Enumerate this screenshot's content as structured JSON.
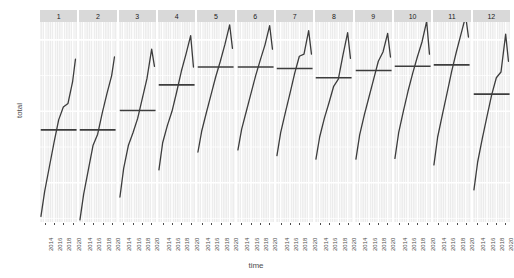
{
  "chart_data": {
    "type": "line",
    "title": "",
    "xlabel": "time",
    "ylabel": "total",
    "grid": true,
    "legend": false,
    "facet_variable": "month",
    "facet_labels": [
      "1",
      "2",
      "3",
      "4",
      "5",
      "6",
      "7",
      "8",
      "9",
      "10",
      "11",
      "12"
    ],
    "x_tick_labels": [
      "2014",
      "2016",
      "2018",
      "2020"
    ],
    "x_ticks": [
      2014,
      2016,
      2018,
      2020
    ],
    "xlim": [
      2013.0,
      2021.0
    ],
    "y_tick_labels": [
      "27000",
      "26000",
      "25000"
    ],
    "y_ticks": [
      27000,
      26000,
      25000
    ],
    "ylim": [
      24450,
      27250
    ],
    "line_color": "#3d3d3d",
    "panel_bg": "#ebebeb",
    "strip_bg": "#d9d9d9",
    "gridline_color": "#ffffff",
    "series": [
      {
        "name": "1",
        "x": [
          2013.2,
          2014,
          2015,
          2016,
          2017,
          2018,
          2019,
          2020,
          2020.6
        ],
        "values": [
          24530,
          24880,
          25220,
          25560,
          25880,
          26060,
          26110,
          26420,
          26730
        ],
        "mean_line": 25740
      },
      {
        "name": "2",
        "x": [
          2013.2,
          2014,
          2015,
          2016,
          2017,
          2018,
          2019,
          2020,
          2020.6
        ],
        "values": [
          24480,
          24840,
          25180,
          25520,
          25680,
          25980,
          26250,
          26500,
          26760
        ],
        "mean_line": 25740
      },
      {
        "name": "3",
        "x": [
          2013.2,
          2014,
          2015,
          2016,
          2017,
          2018,
          2019,
          2020,
          2020.6
        ],
        "values": [
          24800,
          25200,
          25520,
          25700,
          25900,
          26180,
          26460,
          26870,
          26630
        ],
        "mean_line": 26010
      },
      {
        "name": "4",
        "x": [
          2013.2,
          2014,
          2015,
          2016,
          2017,
          2018,
          2019,
          2020,
          2020.6
        ],
        "values": [
          25180,
          25560,
          25800,
          26000,
          26270,
          26560,
          26800,
          27060,
          26620
        ],
        "mean_line": 26370
      },
      {
        "name": "5",
        "x": [
          2013.2,
          2014,
          2015,
          2016,
          2017,
          2018,
          2019,
          2020,
          2020.6
        ],
        "values": [
          25430,
          25720,
          25980,
          26230,
          26480,
          26700,
          26940,
          27210,
          26880
        ],
        "mean_line": 26620
      },
      {
        "name": "6",
        "x": [
          2013.2,
          2014,
          2015,
          2016,
          2017,
          2018,
          2019,
          2020,
          2020.6
        ],
        "values": [
          25460,
          25750,
          26000,
          26250,
          26500,
          26720,
          26930,
          27200,
          26870
        ],
        "mean_line": 26620
      },
      {
        "name": "7",
        "x": [
          2013.2,
          2014,
          2015,
          2016,
          2017,
          2018,
          2019,
          2020,
          2020.6
        ],
        "values": [
          25380,
          25700,
          25980,
          26250,
          26530,
          26770,
          26800,
          27130,
          26800
        ],
        "mean_line": 26600
      },
      {
        "name": "8",
        "x": [
          2013.2,
          2014,
          2015,
          2016,
          2017,
          2018,
          2019,
          2020,
          2020.6
        ],
        "values": [
          25330,
          25640,
          25900,
          26120,
          26350,
          26450,
          26790,
          27100,
          26740
        ],
        "mean_line": 26470
      },
      {
        "name": "9",
        "x": [
          2013.2,
          2014,
          2015,
          2016,
          2017,
          2018,
          2019,
          2020,
          2020.6
        ],
        "values": [
          25330,
          25670,
          25950,
          26200,
          26450,
          26700,
          26830,
          27090,
          26760
        ],
        "mean_line": 26570
      },
      {
        "name": "10",
        "x": [
          2013.2,
          2014,
          2015,
          2016,
          2017,
          2018,
          2019,
          2020,
          2020.6
        ],
        "values": [
          25340,
          25700,
          26000,
          26280,
          26530,
          26760,
          26970,
          27260,
          26800
        ],
        "mean_line": 26630
      },
      {
        "name": "11",
        "x": [
          2013.2,
          2014,
          2015,
          2016,
          2017,
          2018,
          2019,
          2020,
          2020.6
        ],
        "values": [
          25250,
          25640,
          25950,
          26250,
          26560,
          26830,
          27080,
          27330,
          27040
        ],
        "mean_line": 26650
      },
      {
        "name": "12",
        "x": [
          2013.2,
          2014,
          2015,
          2016,
          2017,
          2018,
          2019,
          2020,
          2020.6
        ],
        "values": [
          24900,
          25290,
          25620,
          25930,
          26230,
          26470,
          26550,
          27080,
          26700
        ],
        "mean_line": 26240
      }
    ]
  }
}
